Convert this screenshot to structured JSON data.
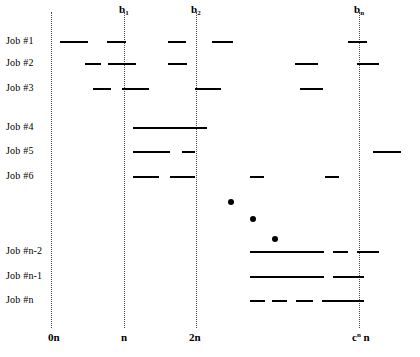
{
  "figure": {
    "background_color": "#ffffff",
    "line_color": "#000000",
    "guide_color": "#4a4a4a"
  },
  "top_labels": [
    {
      "text": "b",
      "sub": "1",
      "x": 119
    },
    {
      "text": "b",
      "sub": "2",
      "x": 191
    },
    {
      "text": "b",
      "sub": "n",
      "x": 354
    }
  ],
  "guides": [
    {
      "name": "guide-0n",
      "x": 51
    },
    {
      "name": "guide-n",
      "x": 124
    },
    {
      "name": "guide-2n",
      "x": 196
    },
    {
      "name": "guide-cn",
      "x": 359
    }
  ],
  "x_axis_labels": [
    {
      "text": "0n",
      "sup": "",
      "x": 48
    },
    {
      "text": "n",
      "sup": "",
      "x": 121
    },
    {
      "text": "2n",
      "sup": "",
      "x": 189
    },
    {
      "text": "c",
      "sup": "n",
      "suffix": " n",
      "x": 352
    }
  ],
  "rows": [
    {
      "label": "Job #1",
      "y": 41
    },
    {
      "label": "Job #2",
      "y": 63
    },
    {
      "label": "Job #3",
      "y": 88
    },
    {
      "label": "Job #4",
      "y": 127
    },
    {
      "label": "Job #5",
      "y": 151
    },
    {
      "label": "Job #6",
      "y": 176
    },
    {
      "label": "Job #n-2",
      "y": 251
    },
    {
      "label": "Job #n-1",
      "y": 276
    },
    {
      "label": "Job #n",
      "y": 300
    }
  ],
  "chart_data": {
    "type": "timeline",
    "xlabel": "",
    "ylabel": "",
    "x_ticks": [
      "0n",
      "n",
      "2n",
      "c^n n"
    ],
    "x_tick_positions": [
      51,
      124,
      196,
      359
    ],
    "top_ticks": [
      "b_1",
      "b_2",
      "b_n"
    ],
    "categories": [
      "Job #1",
      "Job #2",
      "Job #3",
      "Job #4",
      "Job #5",
      "Job #6",
      "Job #n-2",
      "Job #n-1",
      "Job #n"
    ],
    "series": [
      {
        "name": "Job #1",
        "row_y": 41,
        "intervals": [
          [
            60,
            88
          ],
          [
            107,
            126
          ],
          [
            168,
            186
          ],
          [
            212,
            233
          ],
          [
            348,
            367
          ]
        ]
      },
      {
        "name": "Job #2",
        "row_y": 63,
        "intervals": [
          [
            85,
            101
          ],
          [
            108,
            136
          ],
          [
            168,
            187
          ],
          [
            295,
            318
          ],
          [
            357,
            379
          ]
        ]
      },
      {
        "name": "Job #3",
        "row_y": 88,
        "intervals": [
          [
            93,
            111
          ],
          [
            122,
            149
          ],
          [
            195,
            221
          ],
          [
            300,
            323
          ]
        ]
      },
      {
        "name": "Job #4",
        "row_y": 127,
        "intervals": [
          [
            133,
            207
          ]
        ]
      },
      {
        "name": "Job #5",
        "row_y": 151,
        "intervals": [
          [
            133,
            170
          ],
          [
            182,
            195
          ],
          [
            373,
            401
          ]
        ]
      },
      {
        "name": "Job #6",
        "row_y": 176,
        "intervals": [
          [
            133,
            159
          ],
          [
            170,
            195
          ],
          [
            250,
            264
          ],
          [
            325,
            339
          ]
        ]
      },
      {
        "name": "Job #n-2",
        "row_y": 251,
        "intervals": [
          [
            250,
            324
          ],
          [
            333,
            348
          ],
          [
            357,
            379
          ]
        ]
      },
      {
        "name": "Job #n-1",
        "row_y": 276,
        "intervals": [
          [
            250,
            324
          ],
          [
            333,
            364
          ]
        ]
      },
      {
        "name": "Job #n",
        "row_y": 300,
        "intervals": [
          [
            250,
            265
          ],
          [
            272,
            287
          ],
          [
            296,
            313
          ],
          [
            322,
            364
          ]
        ]
      }
    ],
    "ellipsis_dots": [
      {
        "x": 228,
        "y": 199
      },
      {
        "x": 250,
        "y": 216
      },
      {
        "x": 272,
        "y": 236
      }
    ],
    "grid": false,
    "legend": "none"
  }
}
